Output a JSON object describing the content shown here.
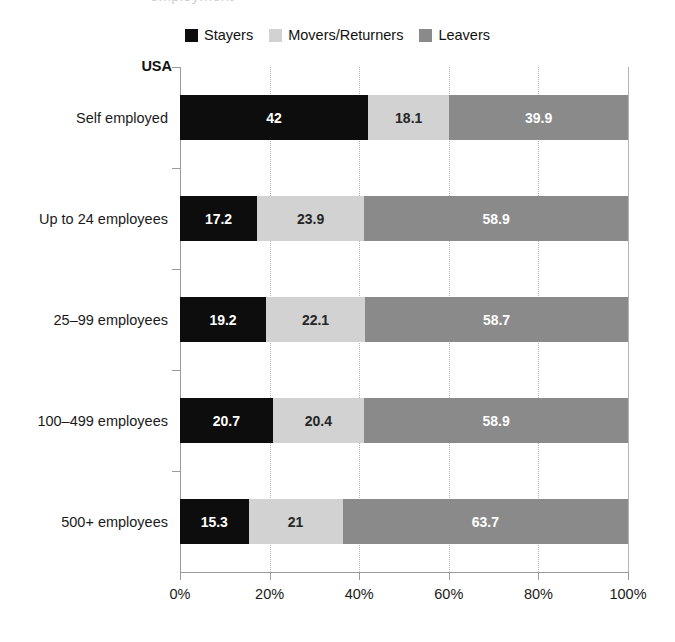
{
  "top_crop": {
    "text": "employment"
  },
  "group_label": "USA",
  "legend": {
    "items": [
      {
        "label": "Stayers",
        "color": "#0d0d0d",
        "icon": "legend-swatch-icon"
      },
      {
        "label": "Movers/Returners",
        "color": "#d2d2d2",
        "icon": "legend-swatch-icon"
      },
      {
        "label": "Leavers",
        "color": "#8a8a8a",
        "icon": "legend-swatch-icon"
      }
    ]
  },
  "chart_data": {
    "type": "bar",
    "title": "",
    "subtitle": "USA",
    "xlabel": "",
    "ylabel": "",
    "orientation": "horizontal",
    "stacked": true,
    "stack_mode": "percent",
    "xlim": [
      0,
      100
    ],
    "xticks": [
      0,
      20,
      40,
      60,
      80,
      100
    ],
    "xticklabels": [
      "0%",
      "20%",
      "40%",
      "60%",
      "80%",
      "100%"
    ],
    "grid": "vertical-dotted",
    "legend_position": "top-center",
    "categories": [
      "Self employed",
      "Up to 24 employees",
      "25–99 employees",
      "100–499 employees",
      "500+ employees"
    ],
    "series": [
      {
        "name": "Stayers",
        "color": "#0d0d0d",
        "values": [
          42,
          17.2,
          19.2,
          20.7,
          15.3
        ],
        "labels": [
          "42",
          "17.2",
          "19.2",
          "20.7",
          "15.3"
        ]
      },
      {
        "name": "Movers/Returners",
        "color": "#d2d2d2",
        "values": [
          18.1,
          23.9,
          22.1,
          20.4,
          21
        ],
        "labels": [
          "18.1",
          "23.9",
          "22.1",
          "20.4",
          "21"
        ]
      },
      {
        "name": "Leavers",
        "color": "#8a8a8a",
        "values": [
          39.9,
          58.9,
          58.7,
          58.9,
          63.7
        ],
        "labels": [
          "39.9",
          "58.9",
          "58.7",
          "58.9",
          "63.7"
        ]
      }
    ]
  }
}
